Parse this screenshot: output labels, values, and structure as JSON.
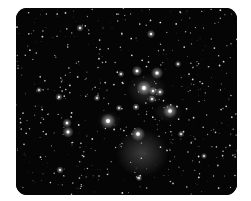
{
  "image": {
    "subject": "star cluster with reflection nebula",
    "background_color": "#050505",
    "frame_color": "#ffffff",
    "bright_stars": [
      {
        "x": 128,
        "y": 80,
        "r": 3.2
      },
      {
        "x": 141,
        "y": 65,
        "r": 2.6
      },
      {
        "x": 121,
        "y": 63,
        "r": 2.2
      },
      {
        "x": 154,
        "y": 103,
        "r": 3.0
      },
      {
        "x": 92,
        "y": 113,
        "r": 3.2
      },
      {
        "x": 122,
        "y": 126,
        "r": 3.0
      },
      {
        "x": 52,
        "y": 124,
        "r": 2.4
      },
      {
        "x": 51,
        "y": 115,
        "r": 2.0
      },
      {
        "x": 137,
        "y": 83,
        "r": 1.8
      },
      {
        "x": 144,
        "y": 84,
        "r": 1.8
      },
      {
        "x": 136,
        "y": 91,
        "r": 1.6
      },
      {
        "x": 120,
        "y": 99,
        "r": 1.6
      },
      {
        "x": 135,
        "y": 26,
        "r": 1.8
      },
      {
        "x": 64,
        "y": 20,
        "r": 1.6
      },
      {
        "x": 43,
        "y": 89,
        "r": 1.6
      },
      {
        "x": 44,
        "y": 162,
        "r": 1.6
      },
      {
        "x": 162,
        "y": 56,
        "r": 1.4
      },
      {
        "x": 105,
        "y": 66,
        "r": 1.4
      },
      {
        "x": 81,
        "y": 90,
        "r": 1.4
      },
      {
        "x": 103,
        "y": 100,
        "r": 1.4
      },
      {
        "x": 165,
        "y": 126,
        "r": 1.4
      },
      {
        "x": 123,
        "y": 170,
        "r": 1.4
      },
      {
        "x": 23,
        "y": 82,
        "r": 1.3
      },
      {
        "x": 188,
        "y": 148,
        "r": 1.3
      }
    ],
    "nebulae": [
      {
        "cx": 126,
        "cy": 145,
        "rx": 26,
        "ry": 24,
        "opacity": 0.28
      },
      {
        "cx": 131,
        "cy": 82,
        "rx": 20,
        "ry": 16,
        "opacity": 0.22
      },
      {
        "cx": 152,
        "cy": 104,
        "rx": 14,
        "ry": 10,
        "opacity": 0.16
      },
      {
        "cx": 93,
        "cy": 113,
        "rx": 12,
        "ry": 10,
        "opacity": 0.15
      }
    ]
  }
}
